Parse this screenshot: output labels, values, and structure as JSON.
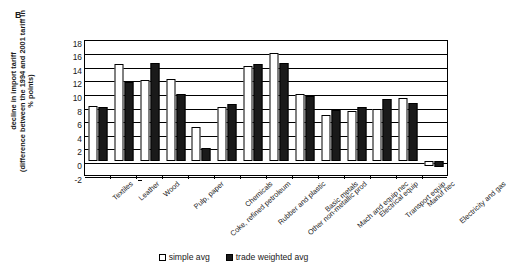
{
  "panel": {
    "letter": "B"
  },
  "legend": {
    "position": "bottom-center",
    "entries": [
      {
        "label": "simple avg",
        "swatch": "open-square",
        "color": "#ffffff"
      },
      {
        "label": "trade weighted avg",
        "swatch": "filled-square",
        "color": "#1a1a1a"
      }
    ]
  },
  "axis": {
    "y_title_lines": [
      "decline in import tariff",
      "(difference between the 1994 and 2001 tariff in",
      "% points)"
    ],
    "y_ticks": [
      18,
      16,
      14,
      12,
      10,
      8,
      6,
      4,
      2,
      0,
      -2
    ]
  },
  "chart_data": {
    "type": "bar",
    "title": "",
    "xlabel": "",
    "ylabel": "decline in import tariff (difference between the 1994 and 2001 tariff in % points)",
    "ylim": [
      -2,
      18
    ],
    "ytick_step": 2,
    "grid": true,
    "legend_position": "bottom-center",
    "categories": [
      "Textiles",
      "Leather",
      "Wood",
      "Pulp, paper",
      "Coke, refined petroleum",
      "Chemicals",
      "Rubber and plastic",
      "Other non-metallic prod",
      "Basic metals",
      "Mach and equip nec",
      "Electrical equip",
      "Transport equip",
      "Manuf nec",
      "Electricity and gas"
    ],
    "series": [
      {
        "name": "simple avg",
        "color": "#ffffff",
        "values": [
          8.1,
          14.3,
          11.9,
          12.1,
          5.0,
          7.9,
          13.9,
          15.9,
          9.9,
          6.8,
          7.3,
          7.6,
          9.3,
          -0.8
        ]
      },
      {
        "name": "trade weighted avg",
        "color": "#1a1a1a",
        "values": [
          8.0,
          11.6,
          14.4,
          9.9,
          1.9,
          8.4,
          14.3,
          14.4,
          9.5,
          7.5,
          7.9,
          9.1,
          8.5,
          -0.9
        ]
      }
    ]
  }
}
